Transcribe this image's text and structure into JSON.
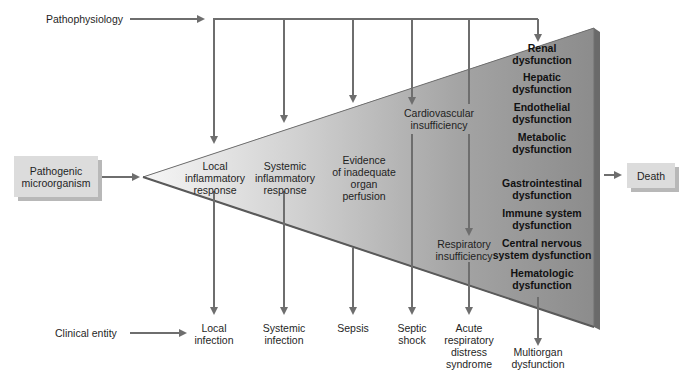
{
  "row_labels": {
    "pathophysiology": "Pathophysiology",
    "clinical_entity": "Clinical entity"
  },
  "start_box": {
    "line1": "Pathogenic",
    "line2": "microorganism"
  },
  "end_box": {
    "label": "Death"
  },
  "stages": [
    {
      "line1": "Local",
      "line2": "inflammatory",
      "line3": "response"
    },
    {
      "line1": "Systemic",
      "line2": "inflammatory",
      "line3": "response"
    },
    {
      "line1": "Evidence",
      "line2": "of inadequate",
      "line3": "organ",
      "line4": "perfusion"
    },
    {
      "line1": "Cardiovascular",
      "line2": "insufficiency"
    },
    {
      "line1": "Respiratory",
      "line2": "insufficiency"
    }
  ],
  "organ_dysfunctions": [
    {
      "line1": "Renal",
      "line2": "dysfunction"
    },
    {
      "line1": "Hepatic",
      "line2": "dysfunction"
    },
    {
      "line1": "Endothelial",
      "line2": "dysfunction"
    },
    {
      "line1": "Metabolic",
      "line2": "dysfunction"
    },
    {
      "line1": "Gastrointestinal",
      "line2": "dysfunction"
    },
    {
      "line1": "Immune system",
      "line2": "dysfunction"
    },
    {
      "line1": "Central nervous",
      "line2": "system dysfunction"
    },
    {
      "line1": "Hematologic",
      "line2": "dysfunction"
    }
  ],
  "clinical_entities": [
    {
      "line1": "Local",
      "line2": "infection"
    },
    {
      "line1": "Systemic",
      "line2": "infection"
    },
    {
      "line1": "Sepsis"
    },
    {
      "line1": "Septic",
      "line2": "shock"
    },
    {
      "line1": "Acute",
      "line2": "respiratory",
      "line3": "distress",
      "line4": "syndrome"
    },
    {
      "line1": "Multiorgan",
      "line2": "dysfunction"
    }
  ],
  "colors": {
    "arrow": "#6e6e6e",
    "triangle_light": "#f4f4f4",
    "triangle_dark": "#8a8a8a",
    "triangle_edge": "#6f6f6f",
    "box_fill": "#dcdcdc"
  }
}
